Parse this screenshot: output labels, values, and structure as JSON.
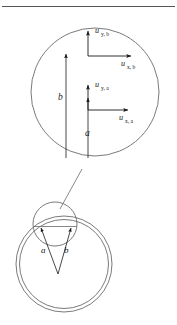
{
  "figure": {
    "title": "",
    "background_color": "#ffffff",
    "stroke_color": "#4d4d4d",
    "text_color": "#1a1a1a",
    "top_rule": {
      "present": true,
      "y": 6,
      "color": "#555555"
    },
    "detail_circle": {
      "name": "magnified-detail-circle",
      "cx": 95,
      "cy": 92,
      "r": 64
    },
    "leader_line": {
      "name": "magnifier-leader-line",
      "x1": 82,
      "y1": 170,
      "x2": 61,
      "y2": 208
    },
    "vectors": [
      {
        "id": "b-magnitude-arrow",
        "label": "b",
        "label_x": 58,
        "label_y": 96,
        "type": "long-vertical",
        "tail_x": 66,
        "tail_y": 158,
        "head_x": 66,
        "head_y": 52
      },
      {
        "id": "a-magnitude-arrow",
        "label": "a",
        "label_x": 92,
        "label_y": 132,
        "type": "short-vertical",
        "tail_x": 88,
        "tail_y": 158,
        "head_x": 88,
        "head_y": 96
      }
    ],
    "components": [
      {
        "id": "uy-b",
        "base": "u",
        "sub": "y, b",
        "label_x": 97,
        "label_y": 32,
        "arrow": {
          "x1": 88,
          "y1": 56,
          "x2": 88,
          "y2": 29
        },
        "orientation": "vertical"
      },
      {
        "id": "ux-b",
        "base": "u",
        "sub": "x, b",
        "label_x": 124,
        "label_y": 74,
        "arrow": {
          "x1": 88,
          "y1": 56,
          "x2": 133,
          "y2": 56
        },
        "orientation": "horizontal"
      },
      {
        "id": "uy-a",
        "base": "u",
        "sub": "y, a",
        "label_x": 97,
        "label_y": 86,
        "arrow": {
          "x1": 88,
          "y1": 110,
          "x2": 88,
          "y2": 83
        },
        "orientation": "vertical"
      },
      {
        "id": "ux-a",
        "base": "u",
        "sub": "x, a",
        "label_x": 124,
        "label_y": 127,
        "arrow": {
          "x1": 88,
          "y1": 110,
          "x2": 130,
          "y2": 110
        },
        "orientation": "horizontal"
      }
    ],
    "source_diagram": {
      "name": "ring-with-bubble",
      "outer_ring": {
        "cx": 64,
        "cy": 264,
        "r": 48
      },
      "inner_ring": {
        "cx": 64,
        "cy": 264,
        "r": 45
      },
      "bubble_circle": {
        "cx": 55,
        "cy": 224,
        "r": 22
      },
      "chord": {
        "x1": 33,
        "y1": 225,
        "x2": 78,
        "y2": 225
      },
      "apex": {
        "x": 58,
        "y": 274
      },
      "arrows": [
        {
          "id": "a-ray",
          "label": "a",
          "label_x": 45,
          "label_y": 250,
          "tail_x": 58,
          "tail_y": 274,
          "head_x": 40,
          "head_y": 226
        },
        {
          "id": "b-ray",
          "label": "b",
          "label_x": 66,
          "label_y": 250,
          "tail_x": 58,
          "tail_y": 274,
          "head_x": 72,
          "head_y": 226
        }
      ]
    }
  }
}
